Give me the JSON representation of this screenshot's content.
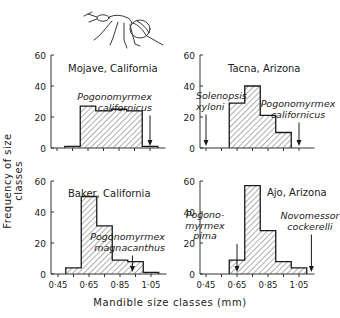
{
  "figure": {
    "ylabel": "Frequency of size classes",
    "xlabel": "Mandible size classes (mm)",
    "illustration": "ant-drawing"
  },
  "chart_data": [
    {
      "type": "bar",
      "title": "Mojave, California",
      "xlabel": "Mandible size classes (mm)",
      "ylabel": "Frequency of size classes",
      "ylim": [
        0,
        60
      ],
      "yticks": [
        0,
        20,
        40,
        60
      ],
      "xlim": [
        0.4,
        1.15
      ],
      "xticks": [
        "0·45",
        "0·65",
        "0·85",
        "1·05"
      ],
      "bins": [
        [
          0.5,
          0.6
        ],
        [
          0.6,
          0.7
        ],
        [
          0.7,
          0.8
        ],
        [
          0.8,
          0.9
        ],
        [
          0.9,
          1.0
        ],
        [
          1.0,
          1.1
        ]
      ],
      "values": [
        1,
        27,
        24,
        25,
        24,
        1
      ],
      "annotations": [
        {
          "text": [
            "Pogonomyrmex",
            "californicus"
          ],
          "x": 1.05
        }
      ]
    },
    {
      "type": "bar",
      "title": "Tacna, Arizona",
      "xlabel": "Mandible size classes (mm)",
      "ylabel": "Frequency of size classes",
      "ylim": [
        0,
        60
      ],
      "yticks": [
        0,
        20,
        40,
        60
      ],
      "xlim": [
        0.4,
        1.15
      ],
      "xticks": [
        "0·45",
        "0·65",
        "0·85",
        "1·05"
      ],
      "bins": [
        [
          0.6,
          0.7
        ],
        [
          0.7,
          0.8
        ],
        [
          0.8,
          0.9
        ],
        [
          0.9,
          1.0
        ]
      ],
      "values": [
        29,
        40,
        21,
        10
      ],
      "annotations": [
        {
          "text": [
            "Solenopsis",
            "xyloni"
          ],
          "x": 0.45
        },
        {
          "text": [
            "Pogonomyrmex",
            "californicus"
          ],
          "x": 1.05
        }
      ]
    },
    {
      "type": "bar",
      "title": "Baker, California",
      "xlabel": "Mandible size classes (mm)",
      "ylabel": "Frequency of size classes",
      "ylim": [
        0,
        60
      ],
      "yticks": [
        0,
        20,
        40,
        60
      ],
      "xlim": [
        0.4,
        1.15
      ],
      "xticks": [
        "0·45",
        "0·65",
        "0·85",
        "1·05"
      ],
      "bins": [
        [
          0.5,
          0.6
        ],
        [
          0.6,
          0.7
        ],
        [
          0.7,
          0.8
        ],
        [
          0.8,
          0.9
        ],
        [
          0.9,
          1.0
        ],
        [
          1.0,
          1.1
        ]
      ],
      "values": [
        4,
        50,
        31,
        9,
        8,
        1
      ],
      "annotations": [
        {
          "text": [
            "Pogonomyrmex",
            "magnacanthus"
          ],
          "x": 0.93
        }
      ]
    },
    {
      "type": "bar",
      "title": "Ajo, Arizona",
      "xlabel": "Mandible size classes (mm)",
      "ylabel": "Frequency of size classes",
      "ylim": [
        0,
        60
      ],
      "yticks": [
        0,
        20,
        40,
        60
      ],
      "xlim": [
        0.4,
        1.15
      ],
      "xticks": [
        "0·45",
        "0·65",
        "0·85",
        "1·05"
      ],
      "bins": [
        [
          0.6,
          0.7
        ],
        [
          0.7,
          0.8
        ],
        [
          0.8,
          0.9
        ],
        [
          0.9,
          1.0
        ],
        [
          1.0,
          1.1
        ]
      ],
      "values": [
        9,
        57,
        28,
        8,
        4
      ],
      "annotations": [
        {
          "text": [
            "Pogono-",
            "myrmex",
            "pima"
          ],
          "x": 0.65
        },
        {
          "text": [
            "Novomessor",
            "cockerelli"
          ],
          "x": 1.13
        }
      ]
    }
  ]
}
